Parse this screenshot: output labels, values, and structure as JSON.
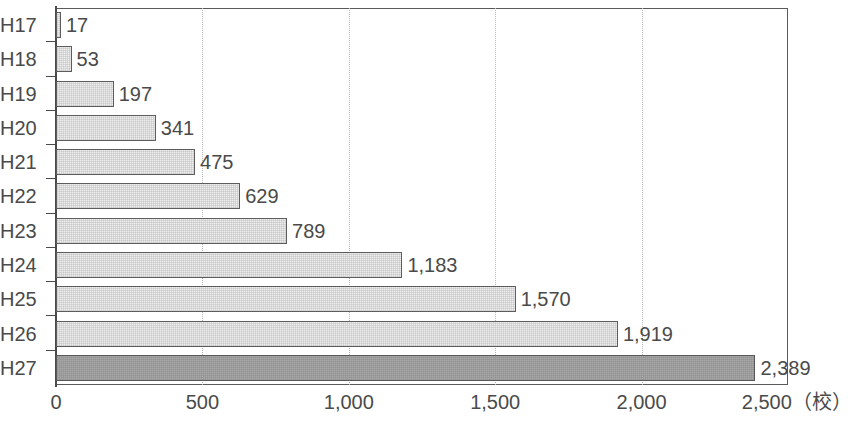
{
  "chart_data": {
    "type": "bar",
    "orientation": "horizontal",
    "title": "",
    "xlabel": "",
    "ylabel": "",
    "unit_label": "(校)",
    "categories": [
      "H17",
      "H18",
      "H19",
      "H20",
      "H21",
      "H22",
      "H23",
      "H24",
      "H25",
      "H26",
      "H27"
    ],
    "values": [
      17,
      53,
      197,
      341,
      475,
      629,
      789,
      1183,
      1570,
      1919,
      2389
    ],
    "value_labels": [
      "17",
      "53",
      "197",
      "341",
      "475",
      "629",
      "789",
      "1,183",
      "1,570",
      "1,919",
      "2,389"
    ],
    "xlim": [
      0,
      2500
    ],
    "x_ticks": [
      0,
      500,
      1000,
      1500,
      2000,
      2500
    ],
    "x_tick_labels": [
      "0",
      "500",
      "1,000",
      "1,500",
      "2,000",
      "2,500（校）"
    ],
    "grid": "vertical-dotted",
    "legend": "none",
    "highlight_index": 10,
    "colors": {
      "bar_fill": "#ededed",
      "bar_border": "#5d5d5d",
      "bar_highlight_fill": "#a8a8a8",
      "axis": "#4a4a4a",
      "gridline": "#b9b9b9",
      "text": "#4a4a4a",
      "background": "#ffffff"
    }
  }
}
